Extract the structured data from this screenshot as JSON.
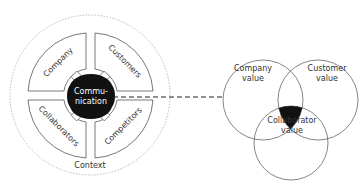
{
  "left_diagram": {
    "outer_label": "Context",
    "center_label_line1": "Commu-",
    "center_label_line2": "nication",
    "quadrants": [
      {
        "label": "Company",
        "position": "top-left"
      },
      {
        "label": "Customers",
        "position": "top-right"
      },
      {
        "label": "Collaborators",
        "position": "bottom-left"
      },
      {
        "label": "Competitors",
        "position": "bottom-right"
      }
    ]
  },
  "right_diagram": {
    "circles": [
      {
        "label_line1": "Company",
        "label_line2": "value"
      },
      {
        "label_line1": "Customer",
        "label_line2": "value"
      },
      {
        "label_line1": "Collaborator",
        "label_line2": "value"
      }
    ],
    "intersection_label": "OVP"
  },
  "connector": {
    "style": "dashed-arrow",
    "from": "Communication",
    "to": "OVP"
  },
  "colors": {
    "line": "#555555",
    "fill_dark": "#111111",
    "text": "#333333",
    "dashed": "#999999"
  }
}
